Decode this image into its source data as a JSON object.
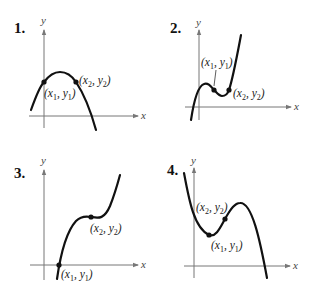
{
  "graphs": [
    {
      "number": "1.",
      "y_axis_label": "y",
      "x_axis_label": "x",
      "point1_label": {
        "x": "x",
        "xsub": "1",
        "y": "y",
        "ysub": "1"
      },
      "point2_label": {
        "x": "x",
        "xsub": "2",
        "y": "y",
        "ysub": "2"
      },
      "shape": "downward parabola"
    },
    {
      "number": "2.",
      "y_axis_label": "y",
      "x_axis_label": "x",
      "point1_label": {
        "x": "x",
        "xsub": "1",
        "y": "y",
        "ysub": "1"
      },
      "point2_label": {
        "x": "x",
        "xsub": "2",
        "y": "y",
        "ysub": "2"
      },
      "shape": "cubic with local max and min"
    },
    {
      "number": "3.",
      "y_axis_label": "y",
      "x_axis_label": "x",
      "point1_label": {
        "x": "x",
        "xsub": "1",
        "y": "y",
        "ysub": "1"
      },
      "point2_label": {
        "x": "x",
        "xsub": "2",
        "y": "y",
        "ysub": "2"
      },
      "shape": "increasing cubic with inflection plateau"
    },
    {
      "number": "4.",
      "y_axis_label": "y",
      "x_axis_label": "x",
      "point1_label": {
        "x": "x",
        "xsub": "1",
        "y": "y",
        "ysub": "1"
      },
      "point2_label": {
        "x": "x",
        "xsub": "2",
        "y": "y",
        "ysub": "2"
      },
      "shape": "negative cubic with local min and max"
    }
  ],
  "p": {
    "open": "(",
    "comma": ", ",
    "close": ")"
  }
}
